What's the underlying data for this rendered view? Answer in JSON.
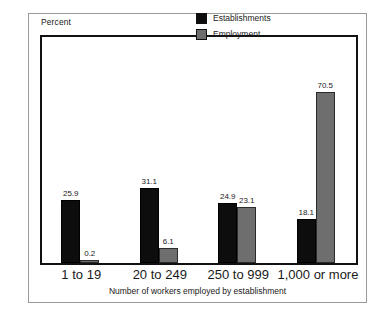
{
  "figure": {
    "percent_label": "Percent",
    "axis_title": "Number of workers employed by establishment"
  },
  "legend": {
    "items": [
      {
        "label": "Establishments",
        "color": "#0d0d0d"
      },
      {
        "label": "Employment",
        "color": "#6e6e6e"
      }
    ]
  },
  "chart_data": {
    "type": "bar",
    "title": "",
    "subtitle": "",
    "xlabel": "Number of workers employed by establishment",
    "ylabel": "Percent",
    "ylim": [
      0,
      75
    ],
    "grid": false,
    "legend_position": "top-right",
    "categories": [
      "1 to 19",
      "20 to 249",
      "250 to 999",
      "1,000 or more"
    ],
    "series": [
      {
        "name": "Establishments",
        "color": "#0d0d0d",
        "values": [
          25.9,
          31.1,
          24.9,
          18.1
        ],
        "labels": [
          "25.9",
          "31.1",
          "24.9",
          "18.1"
        ]
      },
      {
        "name": "Employment",
        "color": "#6e6e6e",
        "values": [
          0.2,
          6.1,
          23.1,
          70.5
        ],
        "labels": [
          "0.2",
          "6.1",
          "23.1",
          "70.5"
        ]
      }
    ]
  },
  "colors": {
    "outer_border": "#9a9a9a",
    "plot_frame": "#111111",
    "background": "#ffffff",
    "text": "#1a1a1a"
  }
}
